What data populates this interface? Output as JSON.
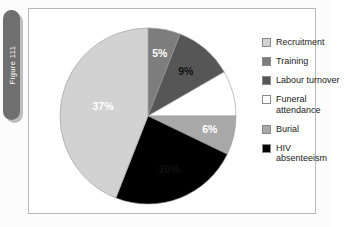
{
  "figure": {
    "tab_label": "Figure 111"
  },
  "legend": {
    "items": [
      {
        "label": "Recruitment",
        "color": "#d2d2d2"
      },
      {
        "label": "Training",
        "color": "#7d7d7d"
      },
      {
        "label": "Labour turnover",
        "color": "#565656"
      },
      {
        "label": "Funeral\nattendance",
        "color": "#ffffff"
      },
      {
        "label": "Burial",
        "color": "#a8a8a8"
      },
      {
        "label": "HIV\nabsenteeism",
        "color": "#000000"
      }
    ]
  },
  "chart_data": {
    "type": "pie",
    "title": "",
    "start_angle_deg": 0,
    "direction": "clockwise",
    "labels": [
      "Training",
      "Labour turnover",
      "Funeral attendance",
      "Burial",
      "HIV absenteeism",
      "Recruitment"
    ],
    "values": [
      5,
      9,
      7,
      6,
      20,
      37
    ],
    "value_suffix": "%",
    "data_labels": [
      "5%",
      "9%",
      "7%",
      "6%",
      "20%",
      "37%"
    ],
    "colors": [
      "#7d7d7d",
      "#565656",
      "#ffffff",
      "#a8a8a8",
      "#000000",
      "#d2d2d2"
    ],
    "label_text_colors": [
      "dark",
      "light",
      "dark",
      "dark",
      "light",
      "dark"
    ],
    "legend_position": "right",
    "grid": false
  }
}
